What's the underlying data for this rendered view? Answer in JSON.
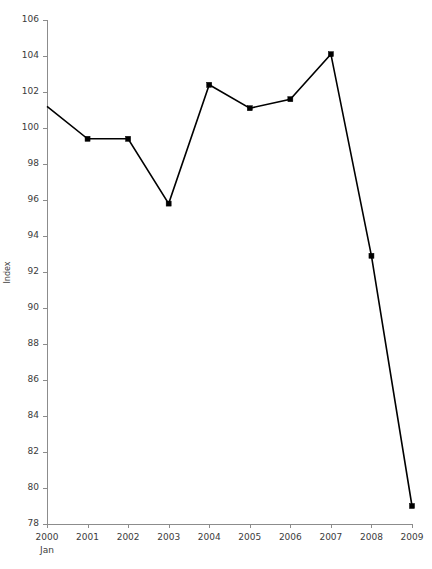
{
  "chart_data": {
    "type": "line",
    "title": "",
    "xlabel": "",
    "ylabel": "Index",
    "x_sublabel": "Jan",
    "categories": [
      "2000",
      "2001",
      "2002",
      "2003",
      "2004",
      "2005",
      "2006",
      "2007",
      "2008",
      "2009"
    ],
    "values": [
      101.2,
      99.4,
      99.4,
      95.8,
      102.4,
      101.1,
      101.6,
      104.1,
      92.9,
      79.0
    ],
    "ylim": [
      78,
      106
    ],
    "ytick_labels": [
      "106",
      "104",
      "102",
      "100",
      "98",
      "96",
      "94",
      "92",
      "90",
      "88",
      "86",
      "84",
      "82",
      "80",
      "78"
    ],
    "ytick_values": [
      106,
      104,
      102,
      100,
      98,
      96,
      94,
      92,
      90,
      88,
      86,
      84,
      82,
      80,
      78
    ],
    "ytick_step": 2,
    "grid": false,
    "legend": null,
    "legend_position": "none",
    "series": [
      {
        "name": "Index",
        "values": [
          101.2,
          99.4,
          99.4,
          95.8,
          102.4,
          101.1,
          101.6,
          104.1,
          92.9,
          79.0
        ]
      }
    ],
    "marker": "square",
    "line_color": "#000000",
    "marker_color": "#000000",
    "axis_color": "#8c8c8c",
    "background_color": "#ffffff"
  },
  "layout": {
    "plot_left": 47,
    "plot_right": 412,
    "plot_top": 20,
    "plot_bottom": 524
  }
}
